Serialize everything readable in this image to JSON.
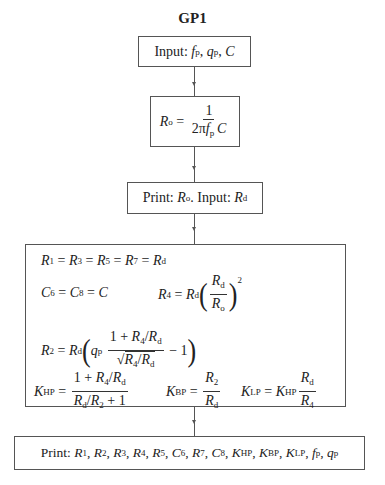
{
  "title": "GP1",
  "boxes": {
    "input": {
      "label": "Input:",
      "vars": [
        "f",
        "q",
        "C"
      ]
    },
    "ro": {
      "lhs": "R",
      "lhs_sub": "o",
      "num": "1",
      "den": "2πf",
      "den_sub": "p",
      "den_tail": "C"
    },
    "print_input": {
      "print_label": "Print:",
      "print_var": "R",
      "print_sub": "o",
      "input_label": "Input:",
      "input_var": "R",
      "input_sub": "d"
    },
    "equations": {
      "line1": "R₁ = R₃ = R₅ = R₇ = R_d",
      "line2a": "C₆ = C₈ = C",
      "line2b": "R₄ = R_d (R_d / R_o)²",
      "line3": "R₂ = R_d ( q_p (1 + R₄/R_d) / √(R₄/R_d) − 1 )",
      "line4a": "K_HP = (1 + R₄/R_d) / (R_d/R₂ + 1)",
      "line4b": "K_BP = R₂ / R_d",
      "line4c": "K_LP = K_HP R_d / R₄"
    },
    "final_print": {
      "label": "Print:",
      "vars": [
        "R1",
        "R2",
        "R3",
        "R4",
        "R5",
        "C6",
        "R7",
        "C8",
        "KHP",
        "KBP",
        "KLP",
        "fp",
        "qp"
      ]
    }
  },
  "sub_p": "p",
  "sub_d": "d",
  "sub_o": "o",
  "one": "1",
  "minus_one": "− 1",
  "one_plus": "1 + ",
  "plus_one": " + 1",
  "eq": " = ",
  "squared": "2"
}
